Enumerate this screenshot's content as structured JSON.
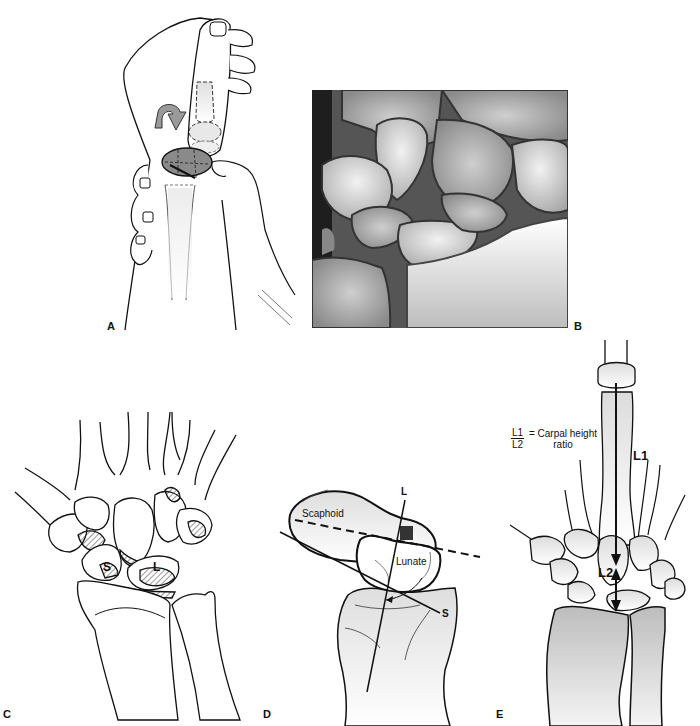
{
  "figure": {
    "panels": [
      {
        "id": "A",
        "label": "A",
        "description": "Hand grasping thumb with rotation arrow over carpal bones"
      },
      {
        "id": "B",
        "label": "B",
        "description": "Radiograph of wrist carpal bones"
      },
      {
        "id": "C",
        "label": "C",
        "description": "Dorsal view of carpus",
        "annotations": {
          "scaphoid": "S",
          "lunate": "L"
        }
      },
      {
        "id": "D",
        "label": "D",
        "description": "Scapholunate angle",
        "annotations": {
          "scaphoid": "Scaphoid",
          "lunate": "Lunate",
          "lunate_axis": "L",
          "scaphoid_axis": "S"
        }
      },
      {
        "id": "E",
        "label": "E",
        "description": "Carpal height ratio",
        "annotations": {
          "l1": "L1",
          "l2": "L2",
          "ratio_numerator": "L1",
          "ratio_denominator": "L2",
          "ratio_text_line1": "= Carpal height",
          "ratio_text_line2": "ratio"
        }
      }
    ]
  },
  "colors": {
    "line": "#111111",
    "bone_fill": "#e6e6e6",
    "dark_fill": "#8a8a8a",
    "arrow_fill": "#9a9a9a"
  }
}
